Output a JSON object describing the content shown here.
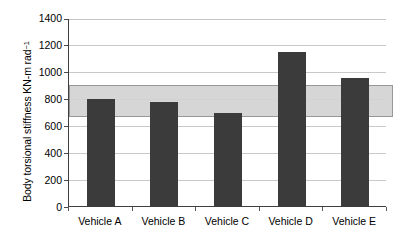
{
  "chart_data": {
    "type": "bar",
    "title": "",
    "xlabel": "",
    "ylabel": "Body torsional stiffness KN-m rad",
    "ylabel_exponent": "−1",
    "categories": [
      "Vehicle A",
      "Vehicle B",
      "Vehicle C",
      "Vehicle D",
      "Vehicle E"
    ],
    "values": [
      805,
      780,
      695,
      1155,
      955
    ],
    "ylim": [
      0,
      1400
    ],
    "ytick_values": [
      0,
      200,
      400,
      600,
      800,
      1000,
      1200,
      1400
    ],
    "ytick_labels": [
      "0",
      "200",
      "400",
      "600",
      "800",
      "1000",
      "1200",
      "1400"
    ],
    "grid": true,
    "legend": "none",
    "bar_color": "#3b3b3b",
    "band": {
      "label": "target stiffness band",
      "lower": 670,
      "upper": 905,
      "color": "#d3d3d3",
      "border_color": "#8f8f8f"
    },
    "axis_color": "#3f3f3f",
    "gridline_color": "#c9c9c9",
    "background": "#ffffff"
  }
}
